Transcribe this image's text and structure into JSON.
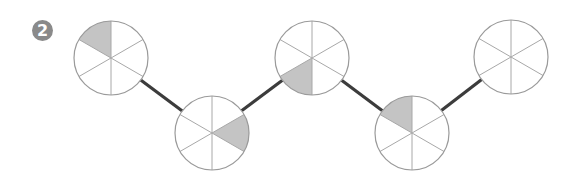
{
  "badge": {
    "label": "2",
    "x": 32,
    "y": 20,
    "color": "#8a8a8a"
  },
  "style": {
    "circle_stroke": "#9a9a9a",
    "spoke_stroke": "#a8a8a8",
    "shade_fill": "#c4c4c4",
    "connector_stroke": "#3c3c3c",
    "radius": 37,
    "sectors_per_circle": 6
  },
  "circles": [
    {
      "id": "circle-1",
      "cx": 111,
      "cy": 58,
      "shaded_sector": "upper-left"
    },
    {
      "id": "circle-2",
      "cx": 212,
      "cy": 133,
      "shaded_sector": "right"
    },
    {
      "id": "circle-3",
      "cx": 312,
      "cy": 58,
      "shaded_sector": "lower-left"
    },
    {
      "id": "circle-4",
      "cx": 412,
      "cy": 133,
      "shaded_sector": "upper-left"
    },
    {
      "id": "circle-5",
      "cx": 511,
      "cy": 57,
      "shaded_sector": null
    }
  ],
  "connectors": [
    {
      "from": "circle-1",
      "to": "circle-2"
    },
    {
      "from": "circle-2",
      "to": "circle-3"
    },
    {
      "from": "circle-3",
      "to": "circle-4"
    },
    {
      "from": "circle-4",
      "to": "circle-5"
    }
  ]
}
